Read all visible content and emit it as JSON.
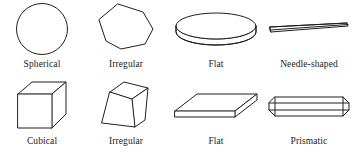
{
  "figure": {
    "background_color": "#ffffff",
    "line_color": "#1f1f1f",
    "fill_color": "#ffffff",
    "rows": [
      {
        "row_id": "top-row",
        "items": [
          {
            "icon": "sphere-shape-icon",
            "label": "Spherical"
          },
          {
            "icon": "irregular-polygon-shape-icon",
            "label": "Irregular"
          },
          {
            "icon": "flat-disc-shape-icon",
            "label": "Flat"
          },
          {
            "icon": "needle-shape-icon",
            "label": "Needle-shaped"
          }
        ]
      },
      {
        "row_id": "bottom-row",
        "items": [
          {
            "icon": "cube-shape-icon",
            "label": "Cubical"
          },
          {
            "icon": "irregular-frustum-shape-icon",
            "label": "Irregular"
          },
          {
            "icon": "flat-plate-shape-icon",
            "label": "Flat"
          },
          {
            "icon": "prismatic-shape-icon",
            "label": "Prismatic"
          }
        ]
      }
    ]
  }
}
